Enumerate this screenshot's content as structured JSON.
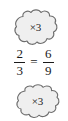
{
  "figure": {
    "background_color": "#ffffff",
    "ink_color": "#1a1a1a",
    "bubble_fill_color": "#efefef",
    "bubble_stroke_color": "#6e6e6e"
  },
  "callouts": {
    "top": {
      "label": "×3",
      "operation": "multiply",
      "factor": "3",
      "applies_to": "numerator"
    },
    "bottom": {
      "label": "×3",
      "operation": "multiply",
      "factor": "3",
      "applies_to": "denominator"
    }
  },
  "equation": {
    "left_fraction": {
      "numerator": "2",
      "denominator": "3"
    },
    "relation": "=",
    "right_fraction": {
      "numerator": "6",
      "denominator": "9"
    }
  }
}
